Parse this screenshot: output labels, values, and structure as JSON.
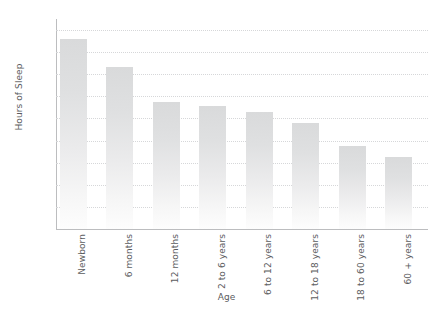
{
  "figure": {
    "cropped_top_text": "",
    "background_color": "#ffffff"
  },
  "chart_data": {
    "type": "bar",
    "title": "",
    "xlabel": "Age",
    "ylabel": "Hours of Sleep",
    "categories": [
      "Newborn",
      "6 months",
      "12 months",
      "2 to 6 years",
      "6 to 12 years",
      "12 to 18 years",
      "18 to 60 years",
      "60 + years"
    ],
    "values": [
      17.2,
      14.7,
      11.5,
      11.1,
      10.6,
      9.6,
      7.5,
      6.5
    ],
    "ylim": [
      0,
      19
    ],
    "yticks": [
      2,
      4,
      6,
      8,
      10,
      12,
      14,
      16,
      18
    ],
    "ytick_labels": [
      "2",
      "4",
      "6",
      "8",
      "10",
      "12",
      "14",
      "16",
      "18"
    ],
    "grid": "horizontal-dotted",
    "legend": "none",
    "bar_color_top": "#d9dadb",
    "bar_color_bottom": "#fdfdfd",
    "axis_color": "#bcbdbf",
    "gridline_color": "#d6d7d9",
    "text_color": "#5b5c5e"
  }
}
